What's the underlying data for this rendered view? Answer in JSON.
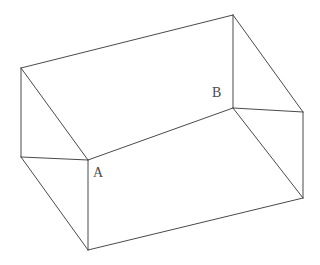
{
  "figure": {
    "type": "line-drawing",
    "background_color": "#ffffff",
    "stroke_color": "#4a4a4a",
    "stroke_width": 1,
    "canvas": {
      "width": 320,
      "height": 265
    },
    "labels": [
      {
        "id": "A",
        "text": "A",
        "x": 93,
        "y": 166,
        "describes": "near-left interior top corner of the box"
      },
      {
        "id": "B",
        "text": "B",
        "x": 212,
        "y": 86,
        "describes": "far-right interior top corner of the box"
      }
    ],
    "vertices": {
      "rim_back_left": {
        "x": 21,
        "y": 68
      },
      "rim_back_right": {
        "x": 233,
        "y": 15
      },
      "rim_front_left": {
        "x": 21,
        "y": 157
      },
      "rim_front_right": {
        "x": 303,
        "y": 112
      },
      "floor_near_left": {
        "x": 88,
        "y": 160
      },
      "floor_far_right": {
        "x": 233,
        "y": 108
      },
      "base_front_left": {
        "x": 88,
        "y": 250
      },
      "base_front_right": {
        "x": 303,
        "y": 198
      }
    },
    "edges": [
      {
        "name": "rim-top-back",
        "from": "rim_back_left",
        "to": "rim_back_right"
      },
      {
        "name": "rim-left-outer-vertical",
        "from": "rim_back_left",
        "to": "rim_front_left"
      },
      {
        "name": "rim-right-outer-vertical",
        "from": "rim_back_right",
        "to": "floor_far_right"
      },
      {
        "name": "rim-front-right-slant",
        "from": "rim_back_right",
        "to": "rim_front_right"
      },
      {
        "name": "rim-front-left-slant",
        "from": "rim_back_left",
        "to": "floor_near_left"
      },
      {
        "name": "interior-floor-line",
        "from": "floor_near_left",
        "to": "floor_far_right"
      },
      {
        "name": "rim-front-edge-left",
        "from": "rim_front_left",
        "to": "floor_near_left"
      },
      {
        "name": "rim-front-edge-right",
        "from": "floor_far_right",
        "to": "rim_front_right"
      },
      {
        "name": "front-left-vertical",
        "from": "floor_near_left",
        "to": "base_front_left"
      },
      {
        "name": "front-right-vertical",
        "from": "rim_front_right",
        "to": "base_front_right"
      },
      {
        "name": "base-front-edge",
        "from": "base_front_left",
        "to": "base_front_right"
      },
      {
        "name": "side-left-slant",
        "from": "rim_front_left",
        "to": "base_front_left"
      },
      {
        "name": "side-right-slant",
        "from": "floor_far_right",
        "to": "base_front_right"
      }
    ]
  }
}
